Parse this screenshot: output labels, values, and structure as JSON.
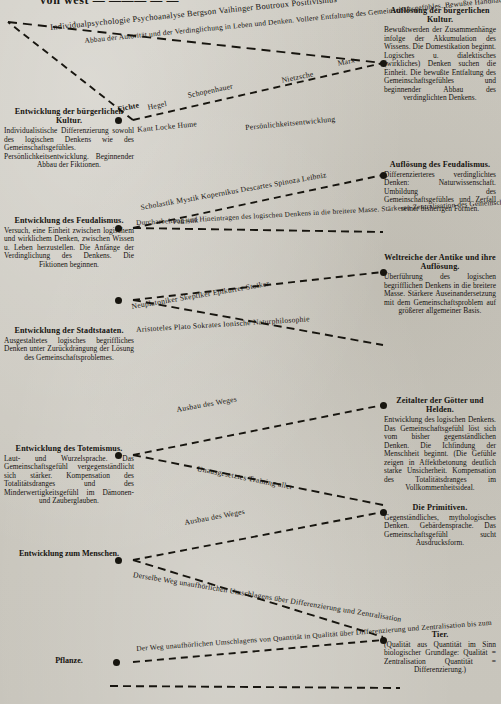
{
  "page": {
    "cropped_header": "von west — ——— — —",
    "ink": "#17150f",
    "paper": "#cdcac2"
  },
  "left_column": [
    {
      "id": "buergerliche-kultur",
      "title": "Entwicklung der bürgerlichen Kultur.",
      "body": "Individualistische Differenzierung sowohl des logischen Denkens wie des Gemeinschaftsgefühles. Persönlichkeitsentwicklung. Beginnender Abbau der Fiktionen."
    },
    {
      "id": "feudalismus",
      "title": "Entwicklung des Feudalismus.",
      "body": "Versuch, eine Einheit zwischen logischem und wirklichem Denken, zwischen Wissen u. Leben herzustellen. Die Anfänge der Verdinglichung des Denkens. Die Fiktionen beginnen."
    },
    {
      "id": "stadtstaaten",
      "title": "Entwicklung der Stadtstaaten.",
      "body": "Ausgestaltetes logisches begriffliches Denken unter Zurückdrängung der Lösung des Gemeinschaftsproblemes."
    },
    {
      "id": "totemismus",
      "title": "Entwicklung des Totemismus.",
      "body": "Laut- und Wurzelsprache. Das Gemeinschaftsgefühl vergegenständlicht sich stärker. Kompensation des Totalitätsdranges und des Minderwertigkeitsgefühl im Dämonen- und Zauberglauben."
    }
  ],
  "left_labels": [
    {
      "id": "zum-menschen",
      "title": "Entwicklung zum Menschen."
    },
    {
      "id": "pflanze",
      "title": "Pflanze."
    }
  ],
  "right_column": [
    {
      "id": "aufloesung-buergerliche-kultur",
      "title": "Auflösung der bürgerlichen Kultur.",
      "body": "Bewußtwerden der Zusammenhänge infolge der Akkumulation des Wissens. Die Domestikation beginnt. Logisches u. dialektisches (wirkliches) Denken suchen die Einheit. Die bewußte Entfaltung des Gemeinschaftsgefühles und beginnender Abbau des verdinglichten Denkens."
    },
    {
      "id": "aufloesung-feudalismus",
      "title": "Auflösung des Feudalismus.",
      "body": "Differenzierteres verdinglichtes Denken: Naturwissenschaft. Umbildung des Gemeinschaftsgefühles und Zerfall seiner bisherigen Formen."
    },
    {
      "id": "weltreiche-antike",
      "title": "Weltreiche der Antike und ihre Auflösung.",
      "body": "Überführung des logischen begrifflichen Denkens in die breitere Masse. Stärkere Auseinandersetzung mit dem Gemeinschaftsproblem auf größerer allgemeiner Basis."
    },
    {
      "id": "zeitalter-goetter-helden",
      "title": "Zeitalter der Götter und Helden.",
      "body": "Entwicklung des logischen Denkens. Das Gemeinschaftsgefühl löst sich vom bisher gegenständlichen Denken. Die Ichfindung der Menschheit beginnt. (Die Gefühle zeigen in Affektbetonung deutlich starke Unsicherheit. Kompensation des Totalitätsdranges im Vollkommenheitsideal."
    },
    {
      "id": "die-primitiven",
      "title": "Die Primitiven.",
      "body": "Gegenständliches, mythologisches Denken. Gebärdensprache. Das Gemeinschaftsgefühl sucht Ausdrucksform."
    },
    {
      "id": "tier",
      "title": "Tier.",
      "body": "(Qualität aus Quantität im Sinn biologischer Grundlage: Qualität = Zentralisation Quantität = Differenzierung.)"
    }
  ],
  "edges": [
    {
      "id": "edge-buergerlich-upper",
      "names": "Individualpsychologie Psychoanalyse Bergson Vaihinger Boutroux Positivismus",
      "caption": "Abbau der Autorität und der Verdinglichung in Leben und Denken. Vollere Entfaltung des Gemeinschaftsgefühles. Bewußte Handhabung der Fiktionen"
    },
    {
      "id": "edge-buergerlich-lower",
      "names_a": "Fichte",
      "names_b": "Hegel",
      "names_c": "Schopenhauer",
      "names_d": "Nietzsche",
      "names_e": "Marx",
      "names_f": "Kant Locke Hume",
      "caption": "Persönlichkeitsentwicklung"
    },
    {
      "id": "edge-feudalismus",
      "names": "Scholastik Mystik Kopernikus Descartes Spinoza Leibniz",
      "sub": "Patristik",
      "caption": "Durcharbeitung und Hineintragen des logischen Denkens in die breitere Masse. Stärkeren Zentralisation des Gemeinschaftsgefühles. Ptolomäus"
    },
    {
      "id": "edge-stadtstaaten",
      "names": "Neuplatoniker Skeptiker Epikurrer Stoiker",
      "names_b": "Aristoteles Plato Sokrates Ionische Naturphilosophie"
    },
    {
      "id": "edge-totemismus-upper",
      "caption": "Ausbau des Weges"
    },
    {
      "id": "edge-totemismus-lower",
      "caption": "Unausgesetztes Training aller"
    },
    {
      "id": "edge-mensch-upper",
      "caption": "Ausbau des Weges"
    },
    {
      "id": "edge-mensch-lower",
      "caption": "Derselbe Weg unaufhörlichen Umschlagens über Differenzierung und Zentralisation"
    },
    {
      "id": "edge-pflanze",
      "caption": "Der Weg unaufhörlichen Umschlagens von Quantität in Qualität über Differenzierung und Zentralisation bis zum"
    }
  ]
}
